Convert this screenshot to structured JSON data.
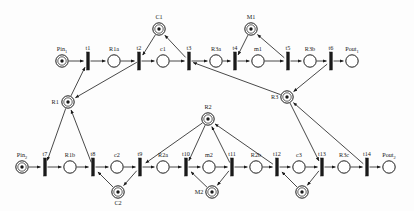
{
  "diagram": {
    "type": "petri-net",
    "colors": {
      "stroke": "#1a1a1a",
      "fill": "#ffffff",
      "token": "#1a1a1a",
      "background": "#fdfdfd"
    }
  },
  "places": [
    {
      "id": "Pin1",
      "label": "Pin",
      "sub": "1",
      "x": 62,
      "y": 61,
      "marked": true,
      "tokens": 1,
      "label_pos": "above"
    },
    {
      "id": "R1a",
      "label": "R1a",
      "sub": "",
      "x": 114,
      "y": 61,
      "marked": false,
      "tokens": 0,
      "label_pos": "above"
    },
    {
      "id": "c1t",
      "label": "c1",
      "sub": "",
      "x": 163,
      "y": 61,
      "marked": false,
      "tokens": 0,
      "label_pos": "above"
    },
    {
      "id": "R3a",
      "label": "R3a",
      "sub": "",
      "x": 216,
      "y": 61,
      "marked": false,
      "tokens": 0,
      "label_pos": "above"
    },
    {
      "id": "m1",
      "label": "m1",
      "sub": "",
      "x": 258,
      "y": 61,
      "marked": false,
      "tokens": 0,
      "label_pos": "above"
    },
    {
      "id": "R3b",
      "label": "R3b",
      "sub": "",
      "x": 310,
      "y": 61,
      "marked": false,
      "tokens": 0,
      "label_pos": "above"
    },
    {
      "id": "Pout1",
      "label": "Pout",
      "sub": "1",
      "x": 352,
      "y": 61,
      "marked": false,
      "tokens": 0,
      "label_pos": "above"
    },
    {
      "id": "C1",
      "label": "C1",
      "sub": "",
      "x": 159,
      "y": 29,
      "marked": true,
      "tokens": 1,
      "label_pos": "above"
    },
    {
      "id": "M1",
      "label": "M1",
      "sub": "",
      "x": 251,
      "y": 29,
      "marked": true,
      "tokens": 1,
      "label_pos": "above"
    },
    {
      "id": "R1",
      "label": "R1",
      "sub": "",
      "x": 68,
      "y": 102,
      "marked": true,
      "tokens": 1,
      "label_pos": "left-above"
    },
    {
      "id": "R2",
      "label": "R2",
      "sub": "",
      "x": 208,
      "y": 119,
      "marked": true,
      "tokens": 1,
      "label_pos": "above"
    },
    {
      "id": "R3",
      "label": "R3",
      "sub": "",
      "x": 287,
      "y": 97,
      "marked": true,
      "tokens": 1,
      "label_pos": "left"
    },
    {
      "id": "Pin2",
      "label": "Pin",
      "sub": "2",
      "x": 22,
      "y": 167,
      "marked": true,
      "tokens": 1,
      "label_pos": "above"
    },
    {
      "id": "R1b",
      "label": "R1b",
      "sub": "",
      "x": 70,
      "y": 167,
      "marked": false,
      "tokens": 0,
      "label_pos": "above"
    },
    {
      "id": "c2",
      "label": "c2",
      "sub": "",
      "x": 117,
      "y": 167,
      "marked": false,
      "tokens": 0,
      "label_pos": "above"
    },
    {
      "id": "R2a",
      "label": "R2a",
      "sub": "",
      "x": 163,
      "y": 167,
      "marked": false,
      "tokens": 0,
      "label_pos": "above"
    },
    {
      "id": "m2",
      "label": "m2",
      "sub": "",
      "x": 209,
      "y": 167,
      "marked": false,
      "tokens": 0,
      "label_pos": "above"
    },
    {
      "id": "R2b",
      "label": "R2b",
      "sub": "",
      "x": 256,
      "y": 167,
      "marked": false,
      "tokens": 0,
      "label_pos": "above"
    },
    {
      "id": "c3",
      "label": "c3",
      "sub": "",
      "x": 299,
      "y": 167,
      "marked": false,
      "tokens": 0,
      "label_pos": "above"
    },
    {
      "id": "R3c",
      "label": "R3c",
      "sub": "",
      "x": 344,
      "y": 167,
      "marked": false,
      "tokens": 0,
      "label_pos": "above"
    },
    {
      "id": "Pout2",
      "label": "Pout",
      "sub": "2",
      "x": 389,
      "y": 167,
      "marked": false,
      "tokens": 0,
      "label_pos": "above"
    },
    {
      "id": "C2",
      "label": "C2",
      "sub": "",
      "x": 118,
      "y": 192,
      "marked": true,
      "tokens": 1,
      "label_pos": "below"
    },
    {
      "id": "M2",
      "label": "M2",
      "sub": "",
      "x": 212,
      "y": 192,
      "marked": true,
      "tokens": 1,
      "label_pos": "left"
    },
    {
      "id": "C1b",
      "label": "",
      "sub": "",
      "x": 302,
      "y": 192,
      "marked": true,
      "tokens": 1,
      "label_pos": "none"
    }
  ],
  "transitions": [
    {
      "id": "t1",
      "label": "t1",
      "x": 88,
      "y": 61
    },
    {
      "id": "t2",
      "label": "t2",
      "x": 139,
      "y": 61
    },
    {
      "id": "t3",
      "label": "t3",
      "x": 189,
      "y": 61
    },
    {
      "id": "t4",
      "label": "t4",
      "x": 235,
      "y": 61
    },
    {
      "id": "t5",
      "label": "t5",
      "x": 288,
      "y": 61
    },
    {
      "id": "t6",
      "label": "t6",
      "x": 331,
      "y": 61
    },
    {
      "id": "t7",
      "label": "t7",
      "x": 45,
      "y": 167
    },
    {
      "id": "t8",
      "label": "t8",
      "x": 93,
      "y": 167
    },
    {
      "id": "t9",
      "label": "t9",
      "x": 140,
      "y": 167
    },
    {
      "id": "t10",
      "label": "t10",
      "x": 186,
      "y": 167
    },
    {
      "id": "t11",
      "label": "t11",
      "x": 232,
      "y": 167
    },
    {
      "id": "t12",
      "label": "t12",
      "x": 277,
      "y": 167
    },
    {
      "id": "t13",
      "label": "t13",
      "x": 322,
      "y": 167
    },
    {
      "id": "t14",
      "label": "t14",
      "x": 367,
      "y": 167
    }
  ],
  "arcs": [
    {
      "from": "Pin1",
      "to": "t1"
    },
    {
      "from": "t1",
      "to": "R1a"
    },
    {
      "from": "R1a",
      "to": "t2"
    },
    {
      "from": "t2",
      "to": "c1t"
    },
    {
      "from": "c1t",
      "to": "t3"
    },
    {
      "from": "t3",
      "to": "R3a"
    },
    {
      "from": "R3a",
      "to": "t4"
    },
    {
      "from": "t4",
      "to": "m1"
    },
    {
      "from": "m1",
      "to": "t5"
    },
    {
      "from": "t5",
      "to": "R3b"
    },
    {
      "from": "R3b",
      "to": "t6"
    },
    {
      "from": "t6",
      "to": "Pout1"
    },
    {
      "from": "C1",
      "to": "t2"
    },
    {
      "from": "t3",
      "to": "C1"
    },
    {
      "from": "M1",
      "to": "t4"
    },
    {
      "from": "t5",
      "to": "M1"
    },
    {
      "from": "R1",
      "to": "t1"
    },
    {
      "from": "t2",
      "to": "R1"
    },
    {
      "from": "R3",
      "to": "t3"
    },
    {
      "from": "t6",
      "to": "R3"
    },
    {
      "from": "Pin2",
      "to": "t7"
    },
    {
      "from": "t7",
      "to": "R1b"
    },
    {
      "from": "R1b",
      "to": "t8"
    },
    {
      "from": "t8",
      "to": "c2"
    },
    {
      "from": "c2",
      "to": "t9"
    },
    {
      "from": "t9",
      "to": "R2a"
    },
    {
      "from": "R2a",
      "to": "t10"
    },
    {
      "from": "t10",
      "to": "m2"
    },
    {
      "from": "m2",
      "to": "t11"
    },
    {
      "from": "t11",
      "to": "R2b"
    },
    {
      "from": "R2b",
      "to": "t12"
    },
    {
      "from": "t12",
      "to": "c3"
    },
    {
      "from": "c3",
      "to": "t13"
    },
    {
      "from": "t13",
      "to": "R3c"
    },
    {
      "from": "R3c",
      "to": "t14"
    },
    {
      "from": "t14",
      "to": "Pout2"
    },
    {
      "from": "R1",
      "to": "t7"
    },
    {
      "from": "t8",
      "to": "R1"
    },
    {
      "from": "C2",
      "to": "t8"
    },
    {
      "from": "t9",
      "to": "C2"
    },
    {
      "from": "R2",
      "to": "t9"
    },
    {
      "from": "t11",
      "to": "R2"
    },
    {
      "from": "M2",
      "to": "t10"
    },
    {
      "from": "t11",
      "to": "M2"
    },
    {
      "from": "R2",
      "to": "t10"
    },
    {
      "from": "t12",
      "to": "R2"
    },
    {
      "from": "C1b",
      "to": "t12"
    },
    {
      "from": "t13",
      "to": "C1b"
    },
    {
      "from": "R3",
      "to": "t13"
    },
    {
      "from": "t14",
      "to": "R3"
    }
  ]
}
